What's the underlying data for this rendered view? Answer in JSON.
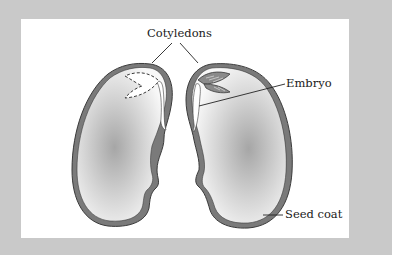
{
  "figure": {
    "labels": {
      "cotyledons": "Cotyledons",
      "embryo": "Embryo",
      "seed_coat": "Seed coat"
    },
    "colors": {
      "frame": "#c9c9c9",
      "panel": "#ffffff",
      "seed_coat": "#7a7a7a",
      "seed_outline": "#3a3a3a",
      "cotyledon_center": "#a9a9a9",
      "cotyledon_edge": "#f7f7f7",
      "leader_line": "#222222"
    },
    "parts": [
      {
        "id": "left-half",
        "embryo_style": "dashed-outline"
      },
      {
        "id": "right-half",
        "embryo_style": "filled-leaf"
      }
    ]
  }
}
